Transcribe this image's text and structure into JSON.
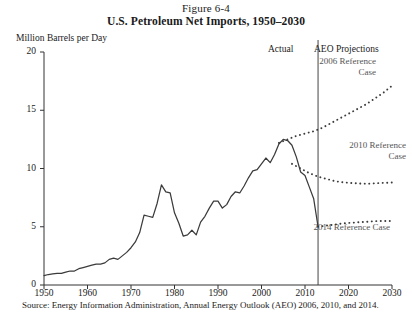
{
  "figure": {
    "label": "Figure 6-4",
    "title": "U.S. Petroleum Net Imports, 1950–2030",
    "source": "Source: Energy Information Administration, Annual Energy Outlook (AEO) 2006, 2010, and 2014."
  },
  "annotations": {
    "actual": "Actual",
    "projections": "AEO Projections",
    "ref2006": "2006 Reference Case",
    "ref2010": "2010 Reference Case",
    "ref2014": "2014 Reference Case"
  },
  "colors": {
    "line": "#3b3b3b",
    "annotation_text": "#555555",
    "axis": "#333333"
  },
  "chart_data": {
    "type": "line",
    "title": "U.S. Petroleum Net Imports, 1950–2030",
    "xlabel": "",
    "ylabel": "Million Barrels per Day",
    "xlim": [
      1950,
      2030
    ],
    "ylim": [
      0,
      20
    ],
    "yticks": [
      0,
      5,
      10,
      15,
      20
    ],
    "xticks": [
      1950,
      1960,
      1970,
      1980,
      1990,
      2000,
      2010,
      2020,
      2030
    ],
    "grid": false,
    "legend": "annotated-inline",
    "divider_year": 2013,
    "series": [
      {
        "name": "Actual",
        "style": "solid",
        "x": [
          1950,
          1951,
          1952,
          1953,
          1954,
          1955,
          1956,
          1957,
          1958,
          1959,
          1960,
          1961,
          1962,
          1963,
          1964,
          1965,
          1966,
          1967,
          1968,
          1969,
          1970,
          1971,
          1972,
          1973,
          1974,
          1975,
          1976,
          1977,
          1978,
          1979,
          1980,
          1981,
          1982,
          1983,
          1984,
          1985,
          1986,
          1987,
          1988,
          1989,
          1990,
          1991,
          1992,
          1993,
          1994,
          1995,
          1996,
          1997,
          1998,
          1999,
          2000,
          2001,
          2002,
          2003,
          2004,
          2005,
          2006,
          2007,
          2008,
          2009,
          2010,
          2011,
          2012,
          2013
        ],
        "y": [
          0.8,
          0.9,
          0.95,
          1.0,
          1.0,
          1.1,
          1.2,
          1.2,
          1.4,
          1.5,
          1.6,
          1.7,
          1.8,
          1.8,
          1.9,
          2.2,
          2.3,
          2.2,
          2.5,
          2.8,
          3.2,
          3.7,
          4.5,
          6.0,
          5.9,
          5.8,
          7.0,
          8.6,
          8.0,
          7.9,
          6.2,
          5.3,
          4.2,
          4.3,
          4.7,
          4.3,
          5.4,
          5.9,
          6.6,
          7.2,
          7.2,
          6.6,
          6.9,
          7.6,
          8.0,
          7.9,
          8.5,
          9.2,
          9.8,
          9.9,
          10.4,
          10.9,
          10.5,
          11.2,
          12.1,
          12.5,
          12.4,
          12.0,
          11.0,
          9.7,
          9.4,
          8.4,
          7.4,
          5.0
        ]
      },
      {
        "name": "2006 Reference Case",
        "style": "dotted",
        "x": [
          2004,
          2006,
          2008,
          2010,
          2012,
          2014,
          2016,
          2018,
          2020,
          2022,
          2024,
          2026,
          2028,
          2030
        ],
        "y": [
          12.2,
          12.5,
          12.8,
          13.0,
          13.2,
          13.5,
          13.9,
          14.3,
          14.7,
          15.1,
          15.5,
          16.0,
          16.5,
          17.1
        ]
      },
      {
        "name": "2010 Reference Case",
        "style": "dotted",
        "x": [
          2007,
          2009,
          2011,
          2013,
          2015,
          2017,
          2019,
          2021,
          2023,
          2025,
          2027,
          2030
        ],
        "y": [
          10.4,
          10.0,
          9.6,
          9.3,
          9.1,
          8.9,
          8.8,
          8.75,
          8.7,
          8.7,
          8.75,
          8.8
        ]
      },
      {
        "name": "2014 Reference Case",
        "style": "dotted",
        "x": [
          2013,
          2015,
          2017,
          2019,
          2021,
          2023,
          2025,
          2027,
          2030
        ],
        "y": [
          5.0,
          5.1,
          5.2,
          5.3,
          5.35,
          5.4,
          5.45,
          5.5,
          5.5
        ]
      }
    ]
  }
}
